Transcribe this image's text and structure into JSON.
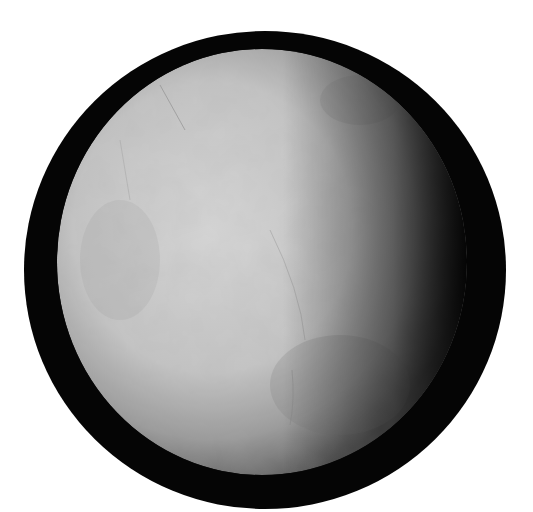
{
  "image": {
    "subject": "planetary-moon",
    "description": "Grayscale icy moon, illuminated from the left, inside a black circular frame on white background",
    "colors": {
      "background": "#ffffff",
      "frame": "#050505",
      "surface_light": "#d4d4d4",
      "surface_mid": "#b5b5b5",
      "surface_dark": "#6a6a6a"
    }
  }
}
